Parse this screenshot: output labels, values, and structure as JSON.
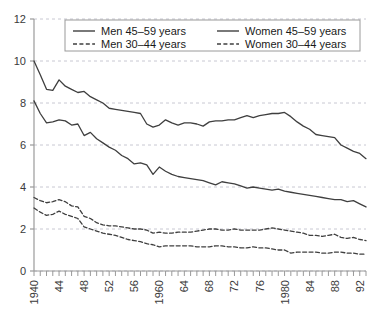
{
  "chart_data": {
    "type": "line",
    "title": "",
    "subtitle": "",
    "xlabel": "",
    "ylabel": "",
    "xlim": [
      1940,
      1993
    ],
    "ylim": [
      0,
      12
    ],
    "ytick_labels": [
      "0",
      "2",
      "4",
      "6",
      "8",
      "10",
      "12"
    ],
    "ytick_values": [
      0,
      2,
      4,
      6,
      8,
      10,
      12
    ],
    "xtick_labels": [
      "1940",
      "44",
      "48",
      "52",
      "56",
      "1960",
      "64",
      "68",
      "72",
      "76",
      "1980",
      "84",
      "88",
      "92"
    ],
    "xtick_values": [
      1940,
      1944,
      1948,
      1952,
      1956,
      1960,
      1964,
      1968,
      1972,
      1976,
      1980,
      1984,
      1988,
      1992
    ],
    "xtick_minor_step": 1,
    "grid": "horizontal-dashed",
    "legend_position": "top-inside",
    "x": [
      1940,
      1941,
      1942,
      1943,
      1944,
      1945,
      1946,
      1947,
      1948,
      1949,
      1950,
      1951,
      1952,
      1953,
      1954,
      1955,
      1956,
      1957,
      1958,
      1959,
      1960,
      1961,
      1962,
      1963,
      1964,
      1965,
      1966,
      1967,
      1968,
      1969,
      1970,
      1971,
      1972,
      1973,
      1974,
      1975,
      1976,
      1977,
      1978,
      1979,
      1980,
      1981,
      1982,
      1983,
      1984,
      1985,
      1986,
      1987,
      1988,
      1989,
      1990,
      1991,
      1992,
      1993
    ],
    "series": [
      {
        "name": "Men 45–59 years",
        "style": "solid",
        "color": "#3f3f3f",
        "values": [
          8.1,
          7.5,
          7.05,
          7.1,
          7.2,
          7.15,
          6.95,
          7.0,
          6.45,
          6.6,
          6.3,
          6.1,
          5.9,
          5.75,
          5.5,
          5.35,
          5.1,
          5.15,
          5.05,
          4.6,
          4.95,
          4.75,
          4.6,
          4.5,
          4.45,
          4.4,
          4.35,
          4.3,
          4.2,
          4.1,
          4.25,
          4.2,
          4.15,
          4.05,
          3.95,
          4.0,
          3.95,
          3.9,
          3.85,
          3.9,
          3.8,
          3.75,
          3.7,
          3.65,
          3.6,
          3.55,
          3.5,
          3.45,
          3.4,
          3.4,
          3.3,
          3.35,
          3.2,
          3.05
        ]
      },
      {
        "name": "Women 45–59 years",
        "style": "solid",
        "color": "#3f3f3f",
        "values": [
          10.0,
          9.35,
          8.65,
          8.6,
          9.1,
          8.8,
          8.65,
          8.5,
          8.55,
          8.3,
          8.15,
          8.0,
          7.75,
          7.7,
          7.65,
          7.6,
          7.55,
          7.5,
          7.0,
          6.85,
          6.95,
          7.2,
          7.05,
          6.95,
          7.05,
          7.05,
          7.0,
          6.9,
          7.1,
          7.15,
          7.15,
          7.2,
          7.2,
          7.3,
          7.4,
          7.3,
          7.4,
          7.45,
          7.5,
          7.5,
          7.55,
          7.35,
          7.1,
          6.9,
          6.75,
          6.5,
          6.45,
          6.4,
          6.35,
          6.0,
          5.85,
          5.7,
          5.6,
          5.35
        ]
      },
      {
        "name": "Men 30–44 years",
        "style": "dashed",
        "color": "#3f3f3f",
        "values": [
          3.5,
          3.35,
          3.25,
          3.3,
          3.4,
          3.3,
          3.1,
          3.05,
          2.6,
          2.5,
          2.3,
          2.2,
          2.15,
          2.15,
          2.1,
          2.05,
          2.0,
          2.0,
          1.95,
          1.8,
          1.85,
          1.8,
          1.8,
          1.85,
          1.85,
          1.85,
          1.9,
          1.95,
          2.0,
          2.0,
          1.95,
          1.95,
          2.0,
          1.95,
          1.95,
          1.95,
          1.95,
          2.0,
          2.05,
          2.0,
          1.95,
          1.9,
          1.85,
          1.8,
          1.7,
          1.7,
          1.65,
          1.7,
          1.75,
          1.6,
          1.55,
          1.6,
          1.5,
          1.45
        ]
      },
      {
        "name": "Women 30–44 years",
        "style": "dashed",
        "color": "#3f3f3f",
        "values": [
          3.0,
          2.8,
          2.65,
          2.7,
          2.85,
          2.7,
          2.6,
          2.5,
          2.1,
          2.0,
          1.9,
          1.8,
          1.75,
          1.7,
          1.6,
          1.5,
          1.45,
          1.4,
          1.3,
          1.25,
          1.15,
          1.2,
          1.2,
          1.2,
          1.2,
          1.2,
          1.15,
          1.15,
          1.15,
          1.2,
          1.2,
          1.15,
          1.15,
          1.1,
          1.1,
          1.15,
          1.1,
          1.1,
          1.05,
          1.0,
          1.0,
          0.85,
          0.9,
          0.9,
          0.9,
          0.9,
          0.85,
          0.85,
          0.9,
          0.9,
          0.85,
          0.85,
          0.8,
          0.8
        ]
      }
    ]
  },
  "legend": {
    "items": [
      {
        "label": "Men 45–59 years",
        "style": "solid"
      },
      {
        "label": "Women 45–59 years",
        "style": "solid"
      },
      {
        "label": "Men 30–44 years",
        "style": "dashed"
      },
      {
        "label": "Women 30–44 years",
        "style": "dashed"
      }
    ]
  },
  "colors": {
    "line": "#3f3f3f",
    "grid": "#c8c8d2",
    "axis": "#9a9a9a",
    "text": "#3a3a3a",
    "legend_border": "#9a9a9a",
    "background": "#ffffff"
  }
}
